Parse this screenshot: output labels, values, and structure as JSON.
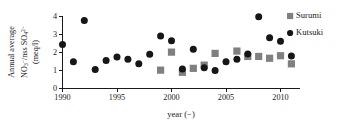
{
  "chart_data": {
    "type": "scatter",
    "title": "",
    "xlabel": "year (−)",
    "ylabel": "Annual average NO3-/nss SO42- (meq/l)",
    "ylabel_lines": [
      "Annual average",
      "NO3−/nss SO42−",
      "(meq/l)"
    ],
    "xlim": [
      1989.4,
      2011.6
    ],
    "ylim": [
      0,
      4
    ],
    "xticks": [
      1990,
      1995,
      2000,
      2005,
      2010
    ],
    "xtick_labels": [
      "1990",
      "1995",
      "2000",
      "2005",
      "2010"
    ],
    "yticks": [
      0,
      1,
      2,
      3,
      4
    ],
    "ytick_labels": [
      "0",
      "1",
      "2",
      "3",
      "4"
    ],
    "grid": false,
    "legend_position": "right",
    "series": [
      {
        "name": "Surumi",
        "marker": "square",
        "color": "#808080",
        "points": [
          {
            "x": 1999,
            "y": 1.02
          },
          {
            "x": 2000,
            "y": 2.02
          },
          {
            "x": 2001,
            "y": 0.9
          },
          {
            "x": 2002,
            "y": 1.12
          },
          {
            "x": 2003,
            "y": 1.3
          },
          {
            "x": 2004,
            "y": 1.95
          },
          {
            "x": 2006,
            "y": 2.08
          },
          {
            "x": 2007,
            "y": 1.78
          },
          {
            "x": 2008,
            "y": 1.78
          },
          {
            "x": 2009,
            "y": 1.68
          },
          {
            "x": 2010,
            "y": 1.82
          },
          {
            "x": 2011,
            "y": 1.37
          }
        ]
      },
      {
        "name": "Kutsuki",
        "marker": "circle",
        "color": "#161616",
        "points": [
          {
            "x": 1990,
            "y": 2.45
          },
          {
            "x": 1991,
            "y": 1.48
          },
          {
            "x": 1992,
            "y": 3.78
          },
          {
            "x": 1993,
            "y": 1.05
          },
          {
            "x": 1994,
            "y": 1.56
          },
          {
            "x": 1995,
            "y": 1.75
          },
          {
            "x": 1996,
            "y": 1.62
          },
          {
            "x": 1997,
            "y": 1.37
          },
          {
            "x": 1998,
            "y": 1.9
          },
          {
            "x": 1999,
            "y": 2.92
          },
          {
            "x": 2000,
            "y": 2.65
          },
          {
            "x": 2001,
            "y": 1.08
          },
          {
            "x": 2002,
            "y": 2.18
          },
          {
            "x": 2003,
            "y": 1.15
          },
          {
            "x": 2004,
            "y": 1.0
          },
          {
            "x": 2005,
            "y": 1.48
          },
          {
            "x": 2006,
            "y": 1.62
          },
          {
            "x": 2007,
            "y": 1.92
          },
          {
            "x": 2008,
            "y": 3.98
          },
          {
            "x": 2009,
            "y": 2.82
          },
          {
            "x": 2010,
            "y": 2.62
          },
          {
            "x": 2011,
            "y": 1.8
          }
        ]
      }
    ]
  },
  "legend": {
    "items": [
      {
        "label": "Surumi",
        "marker": "square",
        "color": "#808080"
      },
      {
        "label": "Kutsuki",
        "marker": "circle",
        "color": "#161616"
      }
    ]
  }
}
